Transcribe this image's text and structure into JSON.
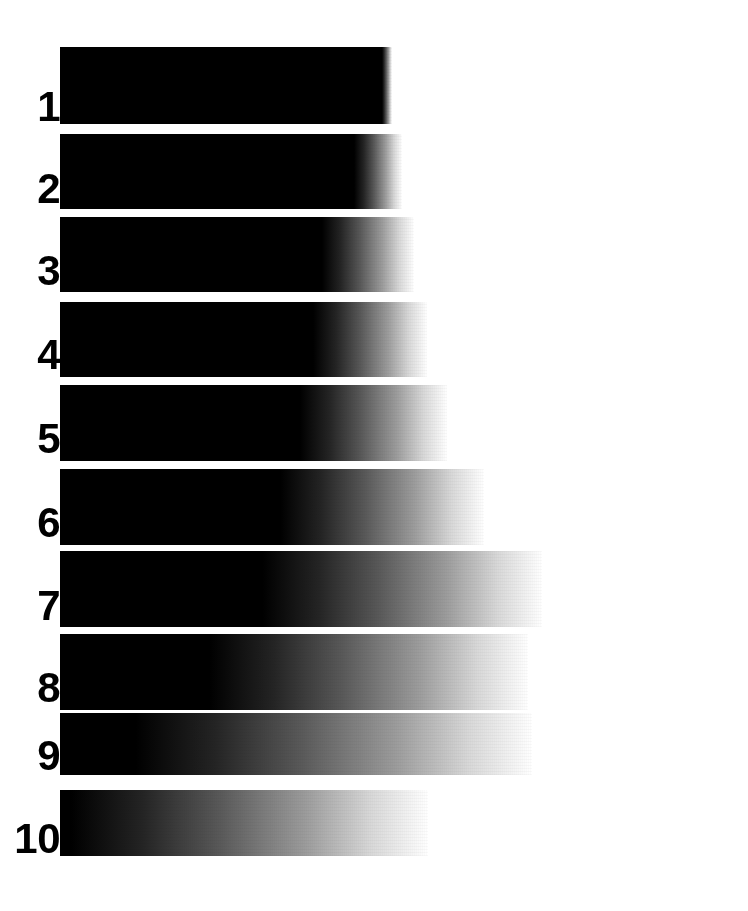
{
  "figure": {
    "kind": "grayscale-step-wedge",
    "background_color": "#ffffff",
    "ink_color": "#000000",
    "width": 748,
    "height": 911,
    "label_color": "#000000",
    "bar_left": 60
  },
  "chart_data": {
    "type": "bar",
    "title": "",
    "subtitle": "",
    "xlabel": "",
    "ylabel": "",
    "legend": [],
    "grid": false,
    "orientation": "horizontal",
    "categories": [
      "1",
      "2",
      "3",
      "4",
      "5",
      "6",
      "7",
      "8",
      "9",
      "10"
    ],
    "values": [
      392,
      400,
      412,
      425,
      445,
      480,
      540,
      525,
      530,
      425
    ],
    "value_meaning": "x pixel where the bar has faded to white (total visible extent from left edge x=60)",
    "series": [
      {
        "name": "solid black end (px)",
        "values": [
          392,
          370,
          340,
          345,
          350,
          325,
          280,
          230,
          140,
          72
        ]
      },
      {
        "name": "white fade end (px)",
        "values": [
          392,
          400,
          412,
          425,
          445,
          480,
          540,
          525,
          530,
          425
        ]
      }
    ],
    "xlim": [
      60,
      748
    ],
    "ylim": [
      0,
      10
    ]
  },
  "rows": [
    {
      "label": "1",
      "top": 47,
      "height": 77,
      "bar_left": 60,
      "bar_width": 332,
      "solid_stop_pct": 97,
      "fade_end_pct": 100,
      "label_left": 14,
      "label_top": 86,
      "label_size": 42
    },
    {
      "label": "2",
      "top": 134,
      "height": 75,
      "bar_left": 60,
      "bar_width": 342,
      "solid_stop_pct": 86,
      "fade_end_pct": 100,
      "label_left": 14,
      "label_top": 168,
      "label_size": 42
    },
    {
      "label": "3",
      "top": 217,
      "height": 75,
      "bar_left": 60,
      "bar_width": 354,
      "solid_stop_pct": 74,
      "fade_end_pct": 100,
      "label_left": 14,
      "label_top": 250,
      "label_size": 42
    },
    {
      "label": "4",
      "top": 302,
      "height": 75,
      "bar_left": 60,
      "bar_width": 367,
      "solid_stop_pct": 69,
      "fade_end_pct": 100,
      "label_left": 14,
      "label_top": 334,
      "label_size": 42
    },
    {
      "label": "5",
      "top": 385,
      "height": 76,
      "bar_left": 60,
      "bar_width": 387,
      "solid_stop_pct": 62,
      "fade_end_pct": 100,
      "label_left": 14,
      "label_top": 418,
      "label_size": 42
    },
    {
      "label": "6",
      "top": 469,
      "height": 76,
      "bar_left": 60,
      "bar_width": 424,
      "solid_stop_pct": 52,
      "fade_end_pct": 100,
      "label_left": 14,
      "label_top": 502,
      "label_size": 42
    },
    {
      "label": "7",
      "top": 551,
      "height": 76,
      "bar_left": 60,
      "bar_width": 482,
      "solid_stop_pct": 42,
      "fade_end_pct": 100,
      "label_left": 14,
      "label_top": 585,
      "label_size": 42
    },
    {
      "label": "8",
      "top": 634,
      "height": 76,
      "bar_left": 60,
      "bar_width": 468,
      "solid_stop_pct": 32,
      "fade_end_pct": 100,
      "label_left": 14,
      "label_top": 667,
      "label_size": 42
    },
    {
      "label": "9",
      "top": 713,
      "height": 62,
      "bar_left": 60,
      "bar_width": 472,
      "solid_stop_pct": 16,
      "fade_end_pct": 100,
      "label_left": 14,
      "label_top": 735,
      "label_size": 42
    },
    {
      "label": "10",
      "top": 790,
      "height": 66,
      "bar_left": 60,
      "bar_width": 368,
      "solid_stop_pct": 3,
      "fade_end_pct": 100,
      "label_left": 9,
      "label_top": 818,
      "label_size": 42
    }
  ]
}
